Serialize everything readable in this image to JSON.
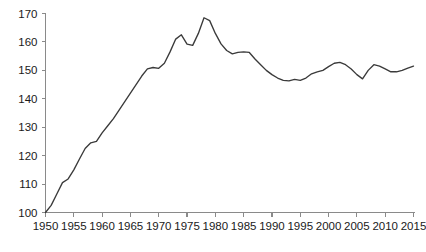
{
  "chart_data": {
    "type": "line",
    "title": "",
    "subtitle": "",
    "xlabel": "",
    "ylabel": "",
    "xlim": [
      1950,
      2015
    ],
    "ylim": [
      100,
      170
    ],
    "grid": false,
    "legend": null,
    "legend_position": "none",
    "line_color": "#3a3a3a",
    "axis_color": "#8a8a8a",
    "background_color": "#ffffff",
    "y_ticks": [
      100,
      110,
      120,
      130,
      140,
      150,
      160,
      170
    ],
    "y_tick_labels": [
      "100",
      "110",
      "120",
      "130",
      "140",
      "150",
      "160",
      "170"
    ],
    "x_ticks": [
      1950,
      1955,
      1960,
      1965,
      1970,
      1975,
      1980,
      1985,
      1990,
      1995,
      2000,
      2005,
      2010,
      2015
    ],
    "x_tick_labels": [
      "1950",
      "1955",
      "1960",
      "1965",
      "1970",
      "1975",
      "1980",
      "1985",
      "1990",
      "1995",
      "2000",
      "2005",
      "2010",
      "2015"
    ],
    "series": [
      {
        "name": "index",
        "x": [
          1950,
          1951,
          1952,
          1953,
          1954,
          1955,
          1956,
          1957,
          1958,
          1959,
          1960,
          1961,
          1962,
          1963,
          1964,
          1965,
          1966,
          1967,
          1968,
          1969,
          1970,
          1971,
          1972,
          1973,
          1974,
          1975,
          1976,
          1977,
          1978,
          1979,
          1980,
          1981,
          1982,
          1983,
          1984,
          1985,
          1986,
          1987,
          1988,
          1989,
          1990,
          1991,
          1992,
          1993,
          1994,
          1995,
          1996,
          1997,
          1998,
          1999,
          2000,
          2001,
          2002,
          2003,
          2004,
          2005,
          2006,
          2007,
          2008,
          2009,
          2010,
          2011,
          2012,
          2013,
          2014,
          2015
        ],
        "values": [
          100.0,
          102.5,
          106.5,
          110.5,
          111.8,
          115.0,
          118.8,
          122.5,
          124.5,
          125.0,
          128.0,
          130.5,
          133.0,
          136.0,
          139.0,
          142.0,
          145.0,
          148.0,
          150.5,
          151.0,
          150.7,
          152.5,
          156.5,
          161.0,
          162.5,
          159.2,
          158.8,
          163.0,
          168.5,
          167.5,
          163.0,
          159.3,
          157.0,
          155.8,
          156.3,
          156.5,
          156.3,
          154.0,
          152.0,
          150.0,
          148.5,
          147.3,
          146.5,
          146.3,
          146.8,
          146.5,
          147.3,
          148.8,
          149.5,
          150.0,
          151.3,
          152.5,
          152.8,
          152.0,
          150.5,
          148.5,
          147.0,
          150.0,
          152.0,
          151.5,
          150.5,
          149.5,
          149.5,
          150.0,
          150.8,
          151.5
        ]
      }
    ]
  }
}
